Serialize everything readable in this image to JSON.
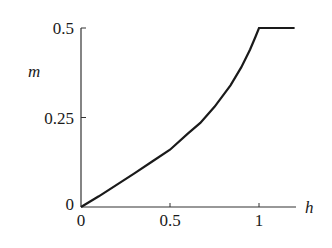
{
  "chart_data": {
    "type": "line",
    "title": "",
    "xlabel": "h",
    "ylabel": "m",
    "xlim": [
      0,
      1.2
    ],
    "ylim": [
      0,
      0.5
    ],
    "grid": false,
    "legend": null,
    "x_ticks": [
      {
        "value": 0,
        "label": "0"
      },
      {
        "value": 0.5,
        "label": "0.5"
      },
      {
        "value": 1,
        "label": "1"
      }
    ],
    "y_ticks": [
      {
        "value": 0,
        "label": "0"
      },
      {
        "value": 0.25,
        "label": "0.25"
      },
      {
        "value": 0.5,
        "label": "0.5"
      }
    ],
    "series": [
      {
        "name": "m(h)",
        "color": "#1a1a1a",
        "x": [
          0,
          0.1,
          0.2,
          0.3,
          0.4,
          0.5,
          0.6,
          0.67,
          0.75,
          0.84,
          0.9,
          0.95,
          0.98,
          1.0,
          1.1,
          1.2
        ],
        "y": [
          0,
          0.03,
          0.062,
          0.094,
          0.127,
          0.16,
          0.205,
          0.235,
          0.28,
          0.34,
          0.39,
          0.44,
          0.475,
          0.5,
          0.5,
          0.5
        ]
      }
    ]
  }
}
